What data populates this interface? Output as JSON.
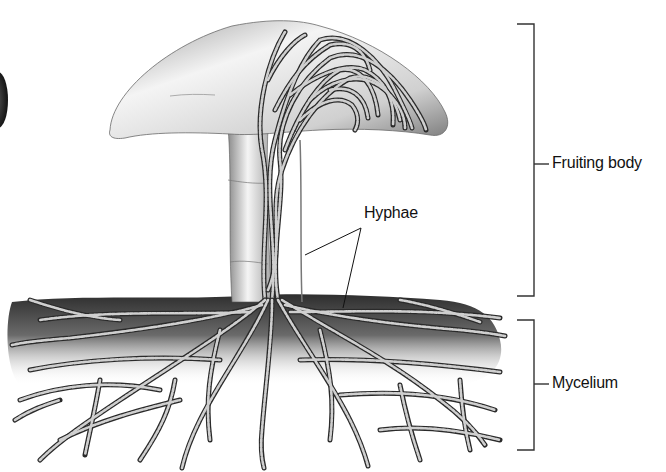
{
  "diagram": {
    "labels": {
      "fruiting_body": "Fruiting body",
      "hyphae": "Hyphae",
      "mycelium": "Mycelium"
    },
    "brackets": [
      {
        "name": "fruiting-body-bracket",
        "label": "Fruiting body",
        "x": 534,
        "y_top": 24,
        "y_bottom": 296
      },
      {
        "name": "mycelium-bracket",
        "label": "Mycelium",
        "x": 534,
        "y_top": 320,
        "y_bottom": 450
      }
    ],
    "colors": {
      "background": "#ffffff",
      "ink": "#111111",
      "cap_light": "#f2f2f2",
      "cap_dark": "#8a8a8a",
      "soil_dark": "#3a3a3a",
      "hypha_fill": "#c9c9c9",
      "hypha_stroke": "#2a2a2a"
    }
  }
}
